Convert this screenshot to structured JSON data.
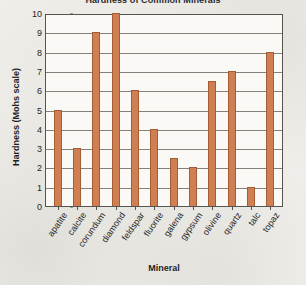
{
  "chart_data": {
    "type": "bar",
    "title": "Hardness of Common Minerals",
    "xlabel": "Mineral",
    "ylabel": "Hardness (Mohs scale)",
    "categories": [
      "apatite",
      "calcite",
      "corundum",
      "diamond",
      "feldspar",
      "fluorite",
      "galena",
      "gypsum",
      "olivine",
      "quartz",
      "talc",
      "topaz"
    ],
    "values": [
      5,
      3,
      9,
      10,
      6,
      4,
      2.5,
      2,
      6.5,
      7,
      1,
      8
    ],
    "ylim": [
      0,
      10
    ],
    "yticks": [
      0,
      1,
      2,
      3,
      4,
      5,
      6,
      7,
      8,
      9,
      10
    ],
    "ytick_labels": [
      "0",
      "1",
      "2",
      "3",
      "4",
      "5",
      "6",
      "7",
      "8",
      "9",
      "10"
    ],
    "grid": true,
    "legend": "none",
    "bar_color": "#cf7f51",
    "bar_edge_color": "#a35c33",
    "gridline_color": "#85827c",
    "plot_background": "#faf9f6",
    "page_background": "#efeeea",
    "axis_color": "#56544f",
    "text_color": "#1f1f1f"
  }
}
